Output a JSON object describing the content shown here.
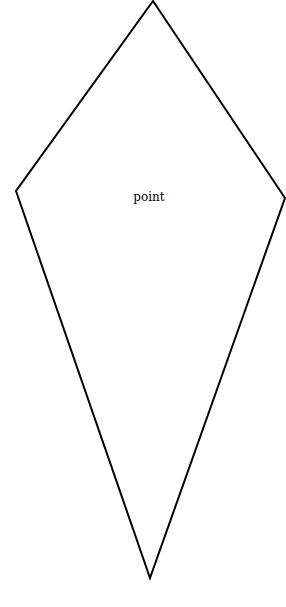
{
  "diagram": {
    "shape": "kite",
    "label": "point",
    "stroke_color": "#000000",
    "fill_color": "#ffffff",
    "stroke_width": 2,
    "vertices": {
      "top": [
        153,
        1
      ],
      "left": [
        16,
        191
      ],
      "bottom": [
        150,
        578
      ],
      "right": [
        285,
        198
      ]
    }
  }
}
